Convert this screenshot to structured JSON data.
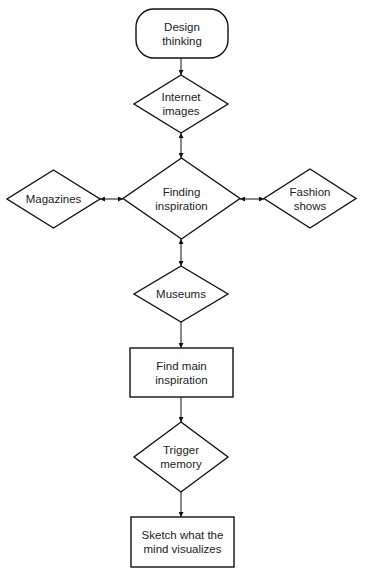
{
  "diagram": {
    "type": "flowchart",
    "colors": {
      "stroke": "#111111",
      "fill": "#ffffff",
      "text": "#222222",
      "background": "#ffffff"
    },
    "nodes": [
      {
        "id": "design-thinking",
        "shape": "rounded-rect",
        "label": "Design\nthinking",
        "x": 136,
        "y": 9,
        "w": 92,
        "h": 49
      },
      {
        "id": "internet-images",
        "shape": "diamond",
        "label": "Internet\nimages",
        "x": 134,
        "y": 75,
        "w": 94,
        "h": 58
      },
      {
        "id": "magazines",
        "shape": "diamond",
        "label": "Magazines",
        "x": 7,
        "y": 170,
        "w": 93,
        "h": 58
      },
      {
        "id": "finding-inspiration",
        "shape": "diamond",
        "label": "Finding\ninspiration",
        "x": 123,
        "y": 158,
        "w": 117,
        "h": 81
      },
      {
        "id": "fashion-shows",
        "shape": "diamond",
        "label": "Fashion\nshows",
        "x": 264,
        "y": 169,
        "w": 92,
        "h": 59
      },
      {
        "id": "museums",
        "shape": "diamond",
        "label": "Museums",
        "x": 134,
        "y": 266,
        "w": 94,
        "h": 56
      },
      {
        "id": "find-main-inspiration",
        "shape": "rect",
        "label": "Find main\ninspiration",
        "x": 130,
        "y": 348,
        "w": 103,
        "h": 49
      },
      {
        "id": "trigger-memory",
        "shape": "diamond",
        "label": "Trigger\nmemory",
        "x": 134,
        "y": 422,
        "w": 94,
        "h": 70
      },
      {
        "id": "sketch-what-the-mind-visualizes",
        "shape": "rect",
        "label": "Sketch what the\nmind visualizes",
        "x": 131,
        "y": 517,
        "w": 103,
        "h": 50
      }
    ],
    "edges": [
      {
        "from": "design-thinking",
        "to": "internet-images",
        "direction": "forward",
        "x1": 181,
        "y1": 58,
        "x2": 181,
        "y2": 75
      },
      {
        "from": "internet-images",
        "to": "finding-inspiration",
        "direction": "both",
        "x1": 181,
        "y1": 133,
        "x2": 181,
        "y2": 158
      },
      {
        "from": "magazines",
        "to": "finding-inspiration",
        "direction": "both",
        "x1": 100,
        "y1": 199,
        "x2": 123,
        "y2": 199
      },
      {
        "from": "finding-inspiration",
        "to": "fashion-shows",
        "direction": "both",
        "x1": 240,
        "y1": 199,
        "x2": 264,
        "y2": 199
      },
      {
        "from": "finding-inspiration",
        "to": "museums",
        "direction": "both",
        "x1": 181,
        "y1": 239,
        "x2": 181,
        "y2": 266
      },
      {
        "from": "museums",
        "to": "find-main-inspiration",
        "direction": "forward",
        "x1": 181,
        "y1": 322,
        "x2": 181,
        "y2": 348
      },
      {
        "from": "find-main-inspiration",
        "to": "trigger-memory",
        "direction": "forward",
        "x1": 181,
        "y1": 397,
        "x2": 181,
        "y2": 422
      },
      {
        "from": "trigger-memory",
        "to": "sketch-what-the-mind-visualizes",
        "direction": "forward",
        "x1": 181,
        "y1": 492,
        "x2": 181,
        "y2": 517
      }
    ]
  }
}
